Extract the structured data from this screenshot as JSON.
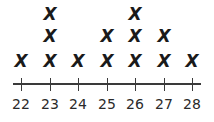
{
  "chart_data": {
    "type": "scatter",
    "subtype": "dot_plot",
    "title": "",
    "xlabel": "",
    "ylabel": "",
    "marker": "X",
    "categories": [
      "22",
      "23",
      "24",
      "25",
      "26",
      "27",
      "28"
    ],
    "values": [
      1,
      3,
      1,
      2,
      3,
      2,
      1
    ],
    "xlim": [
      22,
      28
    ],
    "grid": false,
    "legend": null
  },
  "axis": {
    "tick_labels": [
      "22",
      "23",
      "24",
      "25",
      "26",
      "27",
      "28"
    ]
  },
  "colors": {
    "marker": "#1a1a1a",
    "axis": "#3a3a3a",
    "background": "#ffffff"
  }
}
